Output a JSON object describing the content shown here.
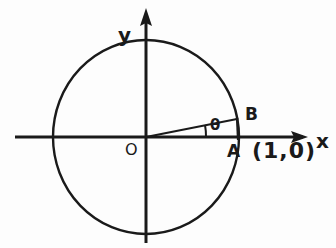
{
  "figure": {
    "stroke_color": "#1a1a1a",
    "background_color": "#fdfdfd",
    "axes": {
      "x_label": "x",
      "y_label": "y",
      "origin_label": "O",
      "x_axis_start_px": 15,
      "x_axis_end_px": 310,
      "y_axis_start_px": 8,
      "y_axis_end_px": 243,
      "axis_y_px": 137,
      "axis_x_px": 146
    },
    "circle": {
      "center_x_px": 146,
      "center_y_px": 137,
      "radius_px": 93,
      "radius_value": 1
    },
    "points": [
      {
        "name": "A",
        "label": "A",
        "coord_label": "(1,0)",
        "x_px": 238,
        "y_px": 137
      },
      {
        "name": "B",
        "label": "B",
        "x_px": 237,
        "y_px": 119
      }
    ],
    "angle": {
      "label": "θ",
      "vertex_x_px": 146,
      "vertex_y_px": 137,
      "degrees": 11
    },
    "segments": [
      {
        "name": "ray-OB",
        "from": "origin",
        "to": "B"
      },
      {
        "name": "drop-B-to-axis",
        "from": "B",
        "to": "A"
      }
    ]
  }
}
